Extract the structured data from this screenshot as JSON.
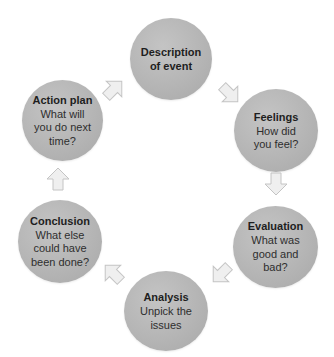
{
  "diagram": {
    "type": "cycle",
    "colors": {
      "node_fill": "#b5b5b5",
      "arrow_fill": "#efefef",
      "arrow_stroke": "#c4c4c4",
      "text": "#222222"
    },
    "nodes": [
      {
        "id": "description",
        "title": "Description\nof event",
        "subtitle": ""
      },
      {
        "id": "feelings",
        "title": "Feelings",
        "subtitle": "How did\nyou feel?"
      },
      {
        "id": "evaluation",
        "title": "Evaluation",
        "subtitle": "What was\ngood and\nbad?"
      },
      {
        "id": "analysis",
        "title": "Analysis",
        "subtitle": "Unpick the\nissues"
      },
      {
        "id": "conclusion",
        "title": "Conclusion",
        "subtitle": "What else\ncould have\nbeen done?"
      },
      {
        "id": "action_plan",
        "title": "Action plan",
        "subtitle": "What will\nyou do next\ntime?"
      }
    ],
    "edges": [
      {
        "from": "description",
        "to": "feelings",
        "icon": "arrow-down-right-icon"
      },
      {
        "from": "feelings",
        "to": "evaluation",
        "icon": "arrow-down-icon"
      },
      {
        "from": "evaluation",
        "to": "analysis",
        "icon": "arrow-down-left-icon"
      },
      {
        "from": "analysis",
        "to": "conclusion",
        "icon": "arrow-up-left-icon"
      },
      {
        "from": "conclusion",
        "to": "action_plan",
        "icon": "arrow-up-icon"
      },
      {
        "from": "action_plan",
        "to": "description",
        "icon": "arrow-up-right-icon"
      }
    ]
  }
}
